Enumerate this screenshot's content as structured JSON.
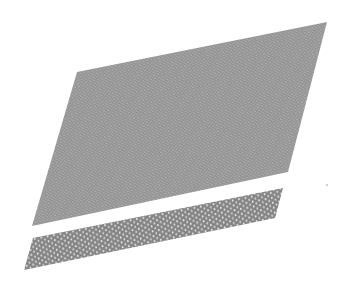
{
  "scene": {
    "background": "#ffffff",
    "description": "Two slanted atomic lattice layers rendered in grey",
    "upper_layer": {
      "fill": "#8c8c8c",
      "dot": "#c8c8c8",
      "points": "77,72 327,22 288,172 32,226"
    },
    "lower_layer": {
      "fill": "#7e7e7e",
      "dot": "#e6e6e6",
      "points": "33,238 283,188 275,218 24,270"
    },
    "speck": {
      "cx": 327,
      "cy": 185,
      "r": 1.2,
      "color": "#cfcfcf"
    }
  }
}
